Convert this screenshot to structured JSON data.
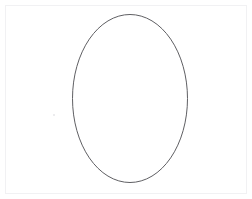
{
  "canvas": {
    "width": 252,
    "height": 199,
    "background_color": "#ffffff",
    "frame": {
      "name": "page-frame",
      "visible": true,
      "inset_px": 5,
      "border_color": "#f1f1f3",
      "border_width": 1
    }
  },
  "shapes": [
    {
      "id": "ellipse-1",
      "type": "ellipse",
      "label": "Ellipse outline",
      "center_x": 130,
      "center_y": 98.5,
      "radius_x": 57.5,
      "radius_y": 84,
      "bounds": {
        "left": 72,
        "top": 14,
        "right": 187,
        "bottom": 183
      },
      "stroke_color": "#5f5f63",
      "stroke_width": 1,
      "fill": "none"
    }
  ],
  "marks": [
    {
      "id": "stray-mark-1",
      "label": "Faint stray speck",
      "x": 53,
      "y": 114,
      "color": "#e6e6e8"
    }
  ],
  "colors": {
    "background": "#ffffff",
    "stroke": "#5f5f63",
    "frame": "#f1f1f3",
    "speck": "#e6e6e8"
  }
}
